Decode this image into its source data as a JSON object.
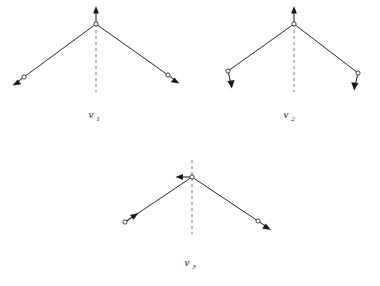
{
  "figure": {
    "background_color": "#ffffff",
    "line_color": "#2b2b2b",
    "arrow_color": "#1a1a1a",
    "axis_color": "#9a9a9a",
    "modes": [
      {
        "id": "nu1",
        "label": "v",
        "subscript": "1",
        "label_text": "v1",
        "description": "symmetric stretch",
        "apex": {
          "x": 96,
          "y": 22
        },
        "left_atom": {
          "x": 22,
          "y": 78
        },
        "right_atom": {
          "x": 170,
          "y": 74
        },
        "axis": {
          "x": 96,
          "y_top": 22,
          "y_bottom": 92
        },
        "apex_arrow_direction": "up",
        "left_arrow_direction": "down-left",
        "right_arrow_direction": "down-right",
        "label_position": {
          "x": 96,
          "y": 118
        }
      },
      {
        "id": "nu2",
        "label": "v",
        "subscript": "2",
        "label_text": "v2",
        "description": "bending",
        "apex": {
          "x": 294,
          "y": 22
        },
        "left_atom": {
          "x": 226,
          "y": 72
        },
        "right_atom": {
          "x": 360,
          "y": 74
        },
        "axis": {
          "x": 294,
          "y_top": 22,
          "y_bottom": 92
        },
        "apex_arrow_direction": "up",
        "left_arrow_direction": "down",
        "right_arrow_direction": "down",
        "label_position": {
          "x": 291,
          "y": 118
        }
      },
      {
        "id": "nu3",
        "label": "v",
        "subscript": "3",
        "label_text": "v3",
        "description": "antisymmetric stretch",
        "apex": {
          "x": 192,
          "y": 177
        },
        "left_atom": {
          "x": 123,
          "y": 223
        },
        "right_atom": {
          "x": 260,
          "y": 222
        },
        "axis": {
          "x": 192,
          "y_top": 160,
          "y_bottom": 234
        },
        "apex_arrow_direction": "left",
        "left_arrow_direction": "up-right",
        "right_arrow_direction": "down-right",
        "label_position": {
          "x": 192,
          "y": 266
        }
      }
    ]
  }
}
